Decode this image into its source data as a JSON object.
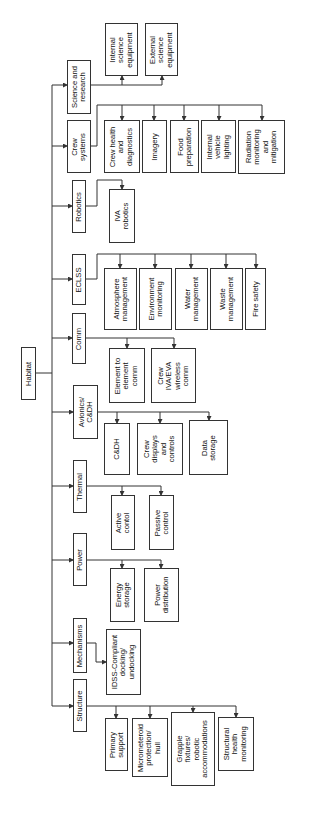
{
  "root": {
    "label": "Habitat"
  },
  "categories": [
    {
      "label": "Science and\nresearch",
      "children": [
        "Internal\nscience\nequipment",
        "External\nscience\nequipment"
      ]
    },
    {
      "label": "Crew\nsystems",
      "children": [
        "Crew health\nand\ndiagnostics",
        "Imagery",
        "Food\npreparation",
        "Internal\nvehicle\nlighting",
        "Radiation\nmonitoring\nand\nmitigation"
      ]
    },
    {
      "label": "Robotics",
      "children": [
        "IVA\nrobotics"
      ]
    },
    {
      "label": "ECLSS",
      "children": [
        "Atmosphere\nmanagement",
        "Environment\nmonitoring",
        "Water\nmanagement",
        "Waste\nmanagement",
        "Fire safety"
      ]
    },
    {
      "label": "Comm",
      "children": [
        "Element to\nelement\ncomm",
        "Crew\nIVA/EVA\nwireless\ncomm"
      ]
    },
    {
      "label": "Avionics/\nC&DH",
      "children": [
        "C&DH",
        "Crew\ndisplays\nand\ncontrols",
        "Data\nstorage"
      ]
    },
    {
      "label": "Thermal",
      "children": [
        "Active\ncontol",
        "Passive\ncontrol"
      ]
    },
    {
      "label": "Power",
      "children": [
        "Energy\nstorage",
        "Power\ndistribution"
      ]
    },
    {
      "label": "Mechanisms",
      "children": [
        "IDSS-Compliant\ndocking/\nundocking"
      ]
    },
    {
      "label": "Structure",
      "children": [
        "Primary\nsupport",
        "Micrometeroid\nprotection/\nhull",
        "Grapple\nfixtures/\nrobotic\naccommodations",
        "Structural\nhealth\nmonitoring"
      ]
    }
  ],
  "colors": {
    "line": "#333333",
    "text": "#111111",
    "background": "#ffffff"
  }
}
